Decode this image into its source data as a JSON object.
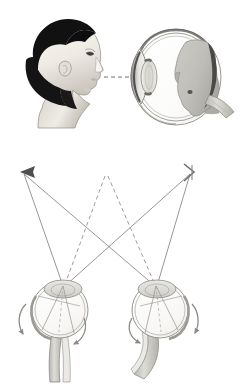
{
  "figure": {
    "title": "Image formation and binocular convergence",
    "background_color": "#ffffff",
    "width": 250,
    "height": 392,
    "panel_count": 2,
    "has_text_labels": false
  },
  "colors": {
    "outline": "#6b6b6b",
    "outline_dark": "#4a4a4a",
    "ray_line": "#7a7a7a",
    "dashed_line": "#8a8a8a",
    "hair_dark": "#111111",
    "skin_light": "#f2efe9",
    "skin_shadow": "#c9c4bc",
    "retina_image_gray": "#c2c0ba",
    "lens_gray": "#d8d6d0",
    "sclera_white": "#fdfdfc",
    "nerve_gray": "#c6c4be",
    "arrow_dark": "#555555",
    "arrow_light": "#b4b4b4"
  },
  "panel_top": {
    "name": "monocular-image-formation",
    "description": "A head seen in profile faces right; a dashed optical axis travels to a cross-sectioned eyeball where an inverted gray image of the head is projected onto the retina.",
    "elements": {
      "head_profile": {
        "name": "head-profile-left",
        "facing": "right",
        "hair_color": "#111111",
        "skin_color": "#f2efe9"
      },
      "optical_axis": {
        "name": "optical-axis-dashed-line",
        "style": "dashed",
        "from_x": 104,
        "to_x": 212,
        "y": 77
      },
      "eyeball": {
        "name": "eyeball-cross-section",
        "center_x": 176,
        "center_y": 77,
        "radius_x": 44,
        "radius_y": 47,
        "parts": [
          "cornea",
          "lens",
          "anterior-chamber",
          "vitreous-body",
          "retina",
          "choroid",
          "sclera",
          "optic-nerve"
        ]
      },
      "retinal_image": {
        "name": "inverted-retinal-image",
        "orientation": "inverted",
        "fill": "#c2c0ba"
      },
      "optic_nerve": {
        "name": "optic-nerve-stub",
        "direction": "lower-right"
      }
    }
  },
  "panel_bottom": {
    "name": "binocular-convergence",
    "description": "Two eyeballs viewed from above converge on a horizontal double-headed arrow object; solid rays run from each arrow tip to both eyes and cross, while dashed rays run from the arrow centre to each eye. Curved arrows show eye rotation.",
    "object_arrow": {
      "name": "object-double-headed-arrow",
      "left_tip_x": 22,
      "right_tip_x": 192,
      "y": 172,
      "center_x": 107,
      "gradient_from": "#555555",
      "gradient_to": "#b4b4b4",
      "arrowhead_left": "solid-filled",
      "arrowhead_right": "open-thin"
    },
    "left_eye": {
      "name": "eyeball-top-view-left",
      "center_x": 60,
      "center_y": 310,
      "radius": 28,
      "node_x": 63,
      "node_y": 285,
      "rotation_arrow": {
        "name": "rotation-arrow-left-eye",
        "direction": "clockwise",
        "side": "outer-left"
      },
      "optic_nerve": {
        "name": "optic-nerve-left",
        "direction": "down"
      }
    },
    "right_eye": {
      "name": "eyeball-top-view-right",
      "center_x": 160,
      "center_y": 310,
      "radius": 28,
      "node_x": 155,
      "node_y": 285,
      "rotation_arrow": {
        "name": "rotation-arrow-right-eye",
        "direction": "counter-clockwise",
        "side": "outer-left"
      },
      "optic_nerve": {
        "name": "optic-nerve-right",
        "direction": "down-left"
      }
    },
    "rays": {
      "name": "convergence-rays",
      "solid_ray_count": 4,
      "dashed_ray_count": 2,
      "solid_style": "solid",
      "dashed_style": "dashed",
      "crossing": true
    }
  }
}
